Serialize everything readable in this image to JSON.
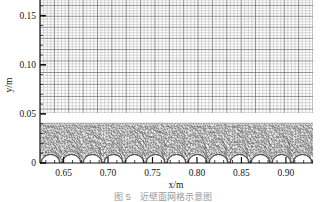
{
  "figure": {
    "kind": "mesh-plot",
    "caption": "图 5　近壁面网格示意图",
    "caption_visible_fragment": "图 5 近壁面网格示意图"
  },
  "axes": {
    "x": {
      "label": "x/m",
      "ticks": [
        0.65,
        0.7,
        0.75,
        0.8,
        0.85,
        0.9
      ],
      "tick_labels": [
        "0.65",
        "0.70",
        "0.75",
        "0.80",
        "0.85",
        "0.90"
      ],
      "min": 0.6235,
      "max": 0.9305,
      "minor_per_major": 5
    },
    "y": {
      "label": "y/m",
      "ticks": [
        0,
        0.05,
        0.1,
        0.15
      ],
      "tick_labels": [
        "0",
        "0.05",
        "0.10",
        "0.15"
      ],
      "min": 0,
      "max": 0.166,
      "minor_per_major": 5
    }
  },
  "chart_data": {
    "type": "mesh",
    "title": "",
    "xlabel": "x/m",
    "ylabel": "y/m",
    "xlim": [
      0.6235,
      0.9305
    ],
    "ylim": [
      0,
      0.166
    ],
    "xticks": [
      0.65,
      0.7,
      0.75,
      0.8,
      0.85,
      0.9
    ],
    "yticks": [
      0,
      0.05,
      0.1,
      0.15
    ],
    "grid": false,
    "legend": "none",
    "regions": [
      {
        "name": "structured-quad-region",
        "mesh_type": "structured-quadrilateral",
        "y_range": [
          0.0405,
          0.166
        ],
        "nx": 76,
        "ny": 42,
        "line_color": "#808080"
      },
      {
        "name": "unstructured-triangle-region",
        "mesh_type": "unstructured-triangular",
        "y_range": [
          0.0075,
          0.0405
        ],
        "line_color": "#555555"
      },
      {
        "name": "dome-void-region",
        "mesh_type": "semicircular-voids",
        "y_range": [
          0.0,
          0.0115
        ],
        "count": 13,
        "line_color": "#555555"
      }
    ]
  },
  "colors": {
    "axis": "#111111",
    "structured_mesh": "#808080",
    "unstructured_mesh": "#545454",
    "background": "#ffffff",
    "caption": "#9a9a9a"
  }
}
